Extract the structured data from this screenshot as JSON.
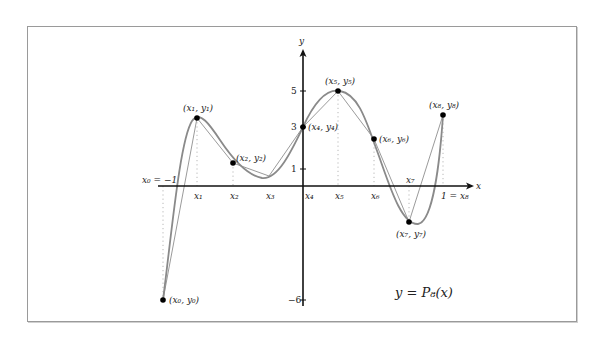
{
  "diagram": {
    "equation_label": "y = P₈(x)",
    "axis_labels": {
      "x": "x",
      "y": "y"
    },
    "y_ticks": [
      {
        "label": "5",
        "value": 5
      },
      {
        "label": "3",
        "value": 3
      },
      {
        "label": "1",
        "value": 1
      },
      {
        "label": "−6",
        "value": -6
      }
    ],
    "x_tick_labels": {
      "x0": "x₀ = −1",
      "x1": "x₁",
      "x2": "x₂",
      "x3": "x₃",
      "x4": "x₄",
      "x5": "x₅",
      "x6": "x₆",
      "x7": "x₇",
      "x8": "1 = x₈"
    },
    "points": [
      {
        "label": "(x₀, y₀)",
        "x": -1.0,
        "y": -6
      },
      {
        "label": "(x₁, y₁)",
        "x": -0.75,
        "y": 3.6
      },
      {
        "label": "(x₂, y₂)",
        "x": -0.5,
        "y": 1.3
      },
      {
        "label": "(x₄, y₄)",
        "x": 0.0,
        "y": 3
      },
      {
        "label": "(x₅, y₅)",
        "x": 0.25,
        "y": 5
      },
      {
        "label": "(x₆, y₆)",
        "x": 0.5,
        "y": 2.5
      },
      {
        "label": "(x₇, y₇)",
        "x": 0.75,
        "y": -1.9
      },
      {
        "label": "(x₈, y₈)",
        "x": 1.0,
        "y": 3.7
      }
    ],
    "colors": {
      "curve": "#8a8a8a",
      "polyline": "#8a8a8a",
      "axes": "#111111",
      "points": "#000000",
      "guides": "#aaaaaa",
      "frame": "#9a9a9a"
    }
  }
}
